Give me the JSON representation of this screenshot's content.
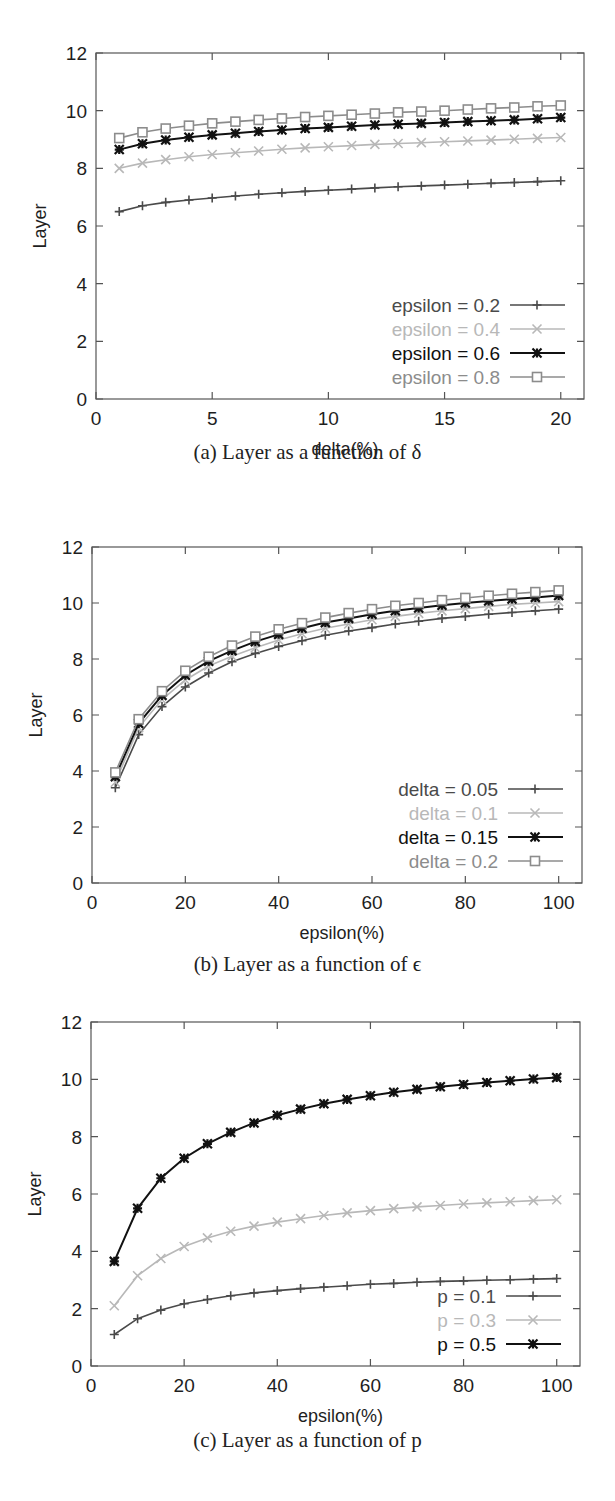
{
  "captions": {
    "a": "(a) Layer as a function of δ",
    "b": "(b) Layer as a function of ϵ",
    "c": "(c) Layer as a function of p"
  },
  "colors": {
    "dark_gray": "#4a4a4a",
    "light_gray": "#b8b8b8",
    "black": "#111111",
    "mid_gray": "#8c8c8c",
    "frame": "#555555"
  },
  "chart_data": [
    {
      "id": "a",
      "type": "line",
      "title": "Layer as a function of δ",
      "xlabel": "delta(%)",
      "ylabel": "Layer",
      "xlim": [
        0,
        21
      ],
      "ylim": [
        0,
        12
      ],
      "xticks": [
        0,
        5,
        10,
        15,
        20
      ],
      "yticks": [
        0,
        2,
        4,
        6,
        8,
        10,
        12
      ],
      "grid": false,
      "legend_position": "lower right",
      "x": [
        1,
        2,
        3,
        4,
        5,
        6,
        7,
        8,
        9,
        10,
        11,
        12,
        13,
        14,
        15,
        16,
        17,
        18,
        19,
        20
      ],
      "series": [
        {
          "name": "epsilon = 0.2",
          "color": "#4a4a4a",
          "marker": "plus",
          "values": [
            6.5,
            6.7,
            6.82,
            6.9,
            6.97,
            7.04,
            7.1,
            7.15,
            7.2,
            7.24,
            7.28,
            7.32,
            7.36,
            7.39,
            7.42,
            7.45,
            7.48,
            7.51,
            7.54,
            7.57
          ]
        },
        {
          "name": "epsilon = 0.4",
          "color": "#b8b8b8",
          "marker": "cross",
          "values": [
            8.0,
            8.18,
            8.3,
            8.4,
            8.48,
            8.54,
            8.6,
            8.66,
            8.71,
            8.75,
            8.79,
            8.83,
            8.86,
            8.89,
            8.92,
            8.95,
            8.98,
            9.01,
            9.04,
            9.07
          ]
        },
        {
          "name": "epsilon = 0.6",
          "color": "#111111",
          "marker": "star",
          "values": [
            8.65,
            8.85,
            8.98,
            9.08,
            9.16,
            9.22,
            9.28,
            9.33,
            9.38,
            9.42,
            9.46,
            9.5,
            9.53,
            9.56,
            9.59,
            9.62,
            9.65,
            9.68,
            9.72,
            9.76
          ]
        },
        {
          "name": "epsilon = 0.8",
          "color": "#8c8c8c",
          "marker": "square",
          "values": [
            9.05,
            9.25,
            9.38,
            9.48,
            9.56,
            9.62,
            9.68,
            9.73,
            9.78,
            9.82,
            9.86,
            9.9,
            9.94,
            9.97,
            10.0,
            10.04,
            10.08,
            10.11,
            10.15,
            10.18
          ]
        }
      ]
    },
    {
      "id": "b",
      "type": "line",
      "title": "Layer as a function of ϵ",
      "xlabel": "epsilon(%)",
      "ylabel": "Layer",
      "xlim": [
        0,
        105
      ],
      "ylim": [
        0,
        12
      ],
      "xticks": [
        0,
        20,
        40,
        60,
        80,
        100
      ],
      "yticks": [
        0,
        2,
        4,
        6,
        8,
        10,
        12
      ],
      "grid": false,
      "legend_position": "lower right",
      "x": [
        5,
        10,
        15,
        20,
        25,
        30,
        35,
        40,
        45,
        50,
        55,
        60,
        65,
        70,
        75,
        80,
        85,
        90,
        95,
        100
      ],
      "series": [
        {
          "name": "delta = 0.05",
          "color": "#4a4a4a",
          "marker": "plus",
          "values": [
            3.4,
            5.3,
            6.3,
            7.0,
            7.5,
            7.9,
            8.2,
            8.45,
            8.65,
            8.85,
            9.0,
            9.12,
            9.25,
            9.35,
            9.45,
            9.52,
            9.6,
            9.66,
            9.72,
            9.78
          ]
        },
        {
          "name": "delta = 0.1",
          "color": "#b8b8b8",
          "marker": "cross",
          "values": [
            3.6,
            5.55,
            6.55,
            7.25,
            7.75,
            8.1,
            8.4,
            8.68,
            8.9,
            9.1,
            9.25,
            9.4,
            9.52,
            9.63,
            9.72,
            9.8,
            9.88,
            9.95,
            10.0,
            10.05
          ]
        },
        {
          "name": "delta = 0.15",
          "color": "#111111",
          "marker": "star",
          "values": [
            3.8,
            5.7,
            6.7,
            7.42,
            7.92,
            8.3,
            8.62,
            8.88,
            9.1,
            9.3,
            9.45,
            9.6,
            9.72,
            9.82,
            9.92,
            10.0,
            10.07,
            10.14,
            10.2,
            10.27
          ]
        },
        {
          "name": "delta = 0.2",
          "color": "#8c8c8c",
          "marker": "square",
          "values": [
            3.95,
            5.85,
            6.85,
            7.58,
            8.08,
            8.48,
            8.8,
            9.06,
            9.28,
            9.48,
            9.64,
            9.78,
            9.9,
            10.0,
            10.1,
            10.18,
            10.26,
            10.33,
            10.39,
            10.45
          ]
        }
      ]
    },
    {
      "id": "c",
      "type": "line",
      "title": "Layer as a function of p",
      "xlabel": "epsilon(%)",
      "ylabel": "Layer",
      "xlim": [
        0,
        105
      ],
      "ylim": [
        0,
        12
      ],
      "xticks": [
        0,
        20,
        40,
        60,
        80,
        100
      ],
      "yticks": [
        0,
        2,
        4,
        6,
        8,
        10,
        12
      ],
      "grid": false,
      "legend_position": "lower right",
      "x": [
        5,
        10,
        15,
        20,
        25,
        30,
        35,
        40,
        45,
        50,
        55,
        60,
        65,
        70,
        75,
        80,
        85,
        90,
        95,
        100
      ],
      "series": [
        {
          "name": "p = 0.1",
          "color": "#4a4a4a",
          "marker": "plus",
          "values": [
            1.1,
            1.65,
            1.95,
            2.17,
            2.32,
            2.45,
            2.55,
            2.63,
            2.7,
            2.75,
            2.8,
            2.85,
            2.88,
            2.92,
            2.95,
            2.97,
            2.99,
            3.01,
            3.03,
            3.05
          ]
        },
        {
          "name": "p = 0.3",
          "color": "#b8b8b8",
          "marker": "cross",
          "values": [
            2.1,
            3.15,
            3.75,
            4.17,
            4.47,
            4.7,
            4.88,
            5.02,
            5.14,
            5.25,
            5.34,
            5.42,
            5.49,
            5.55,
            5.6,
            5.65,
            5.69,
            5.73,
            5.77,
            5.8
          ]
        },
        {
          "name": "p = 0.5",
          "color": "#111111",
          "marker": "star",
          "values": [
            3.65,
            5.5,
            6.55,
            7.25,
            7.75,
            8.15,
            8.48,
            8.75,
            8.96,
            9.15,
            9.3,
            9.43,
            9.55,
            9.65,
            9.74,
            9.82,
            9.89,
            9.95,
            10.01,
            10.06
          ]
        }
      ]
    }
  ]
}
